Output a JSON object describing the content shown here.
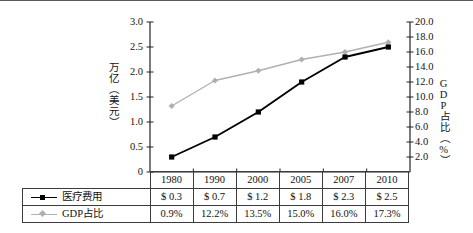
{
  "chart_data": {
    "type": "line",
    "title": "",
    "categories": [
      "1980",
      "1990",
      "2000",
      "2005",
      "2007",
      "2010"
    ],
    "xlabel": "",
    "legend_position": "bottom-left-table",
    "grid": false,
    "axes": {
      "left": {
        "label": "万亿（美元）",
        "ticks": [
          "0",
          "0.5",
          "1.0",
          "1.5",
          "2.0",
          "2.5",
          "3.0"
        ],
        "ylim": [
          0,
          3.0
        ]
      },
      "right": {
        "label": "GDP占比（%）",
        "ticks": [
          "2.0",
          "4.0",
          "6.0",
          "8.0",
          "10.0",
          "12.0",
          "14.0",
          "16.0",
          "18.0",
          "20.0"
        ],
        "ylim": [
          0,
          20.0
        ]
      }
    },
    "series": [
      {
        "name": "医疗费用",
        "axis": "left",
        "color": "#000000",
        "marker": "square",
        "values": [
          0.3,
          0.7,
          1.2,
          1.8,
          2.3,
          2.5
        ],
        "labels": [
          "$ 0.3",
          "$ 0.7",
          "$ 1.2",
          "$ 1.8",
          "$ 2.3",
          "$ 2.5"
        ]
      },
      {
        "name": "GDP占比",
        "axis": "right",
        "color": "#b0b0b0",
        "marker": "diamond",
        "values": [
          8.8,
          12.2,
          13.5,
          15.0,
          16.0,
          17.3
        ],
        "labels": [
          "0.9%",
          "12.2%",
          "13.5%",
          "15.0%",
          "16.0%",
          "17.3%"
        ]
      }
    ]
  },
  "table": {
    "header": [
      "1980",
      "1990",
      "2000",
      "2005",
      "2007",
      "2010"
    ],
    "rows": [
      {
        "label": "医疗费用",
        "marker": "square",
        "values": [
          "$ 0.3",
          "$ 0.7",
          "$ 1.2",
          "$ 1.8",
          "$ 2.3",
          "$ 2.5"
        ]
      },
      {
        "label": "GDP占比",
        "marker": "diamond",
        "values": [
          "0.9%",
          "12.2%",
          "13.5%",
          "15.0%",
          "16.0%",
          "17.3%"
        ]
      }
    ]
  },
  "colors": {
    "series_expense": "#000000",
    "series_gdp": "#b0b0b0",
    "axis": "#222222",
    "table_border": "#3c3c3c"
  }
}
